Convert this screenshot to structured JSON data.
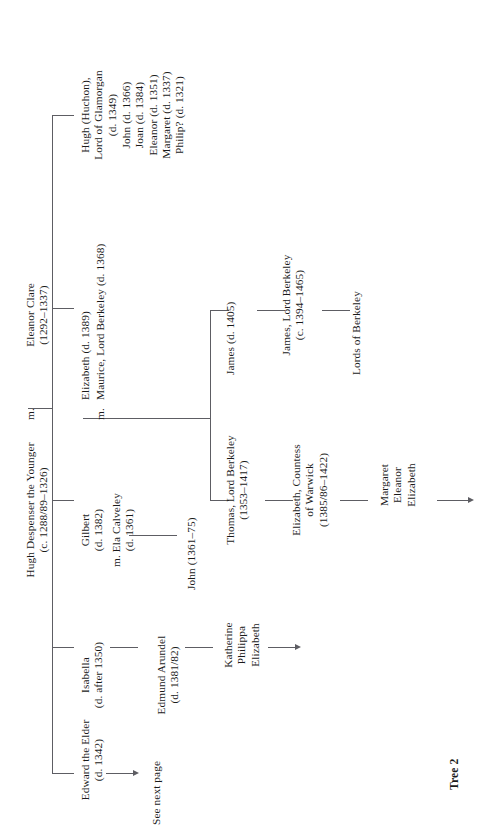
{
  "figure": {
    "caption": "Tree 2",
    "type": "genealogical-family-tree",
    "orientation": "rotated-90-counterclockwise"
  },
  "couple": {
    "husband_name": "Hugh Despenser the Younger",
    "husband_dates": "(c. 1288/89–1326)",
    "marriage_mark": "m.",
    "wife_name": "Eleanor Clare",
    "wife_dates": "(1292–1337)"
  },
  "children": [
    {
      "id": "hugh-huchon",
      "line1": "Hugh (Huchon),",
      "line2": "Lord of Glamorgan",
      "line3": "(d. 1349)",
      "issue": [
        "John (d. 1366)",
        "Joan (d. 1384)",
        "Eleanor (d. 1351)",
        "Margaret (d. 1337)",
        "Philip? (d. 1321)"
      ]
    },
    {
      "id": "elizabeth",
      "name": "Elizabeth (d. 1389)",
      "marriage_mark": "m.",
      "spouse": "Maurice, Lord Berkeley (d. 1368)"
    },
    {
      "id": "gilbert",
      "name": "Gilbert",
      "dates": "(d. 1382)",
      "marriage_mark": "m. Ela Calveley",
      "spouse_dates": "(d. 1361)",
      "child": "John (1361–75)"
    },
    {
      "id": "isabella",
      "name": "Isabella",
      "dates": "(d. after 1350)",
      "spouse": "Edmund Arundel",
      "spouse_dates": "(d. 1381/82)",
      "issue": [
        "Katherine",
        "Philippa",
        "Elizabeth"
      ],
      "continues": true
    },
    {
      "id": "edward",
      "name": "Edward the Elder",
      "dates": "(d. 1342)",
      "link_label": "See next page"
    }
  ],
  "berkeley_branch": {
    "elder_son": "James (d. 1405)",
    "elder_son_child_name": "James, Lord Berkeley",
    "elder_son_child_dates": "(c. 1394–1465)",
    "continuation": "Lords of Berkeley",
    "younger_son": "Thomas, Lord Berkeley",
    "younger_son_dates": "(1353–1417)",
    "daughter_name": "Elizabeth, Countess",
    "daughter_title": "of Warwick",
    "daughter_dates": "(1385/86–1422)",
    "grandchildren": [
      "Margaret",
      "Eleanor",
      "Elizabeth"
    ]
  },
  "style": {
    "line_color": "#5d5d63",
    "text_color": "#1a1a1a",
    "background": "#ffffff"
  }
}
